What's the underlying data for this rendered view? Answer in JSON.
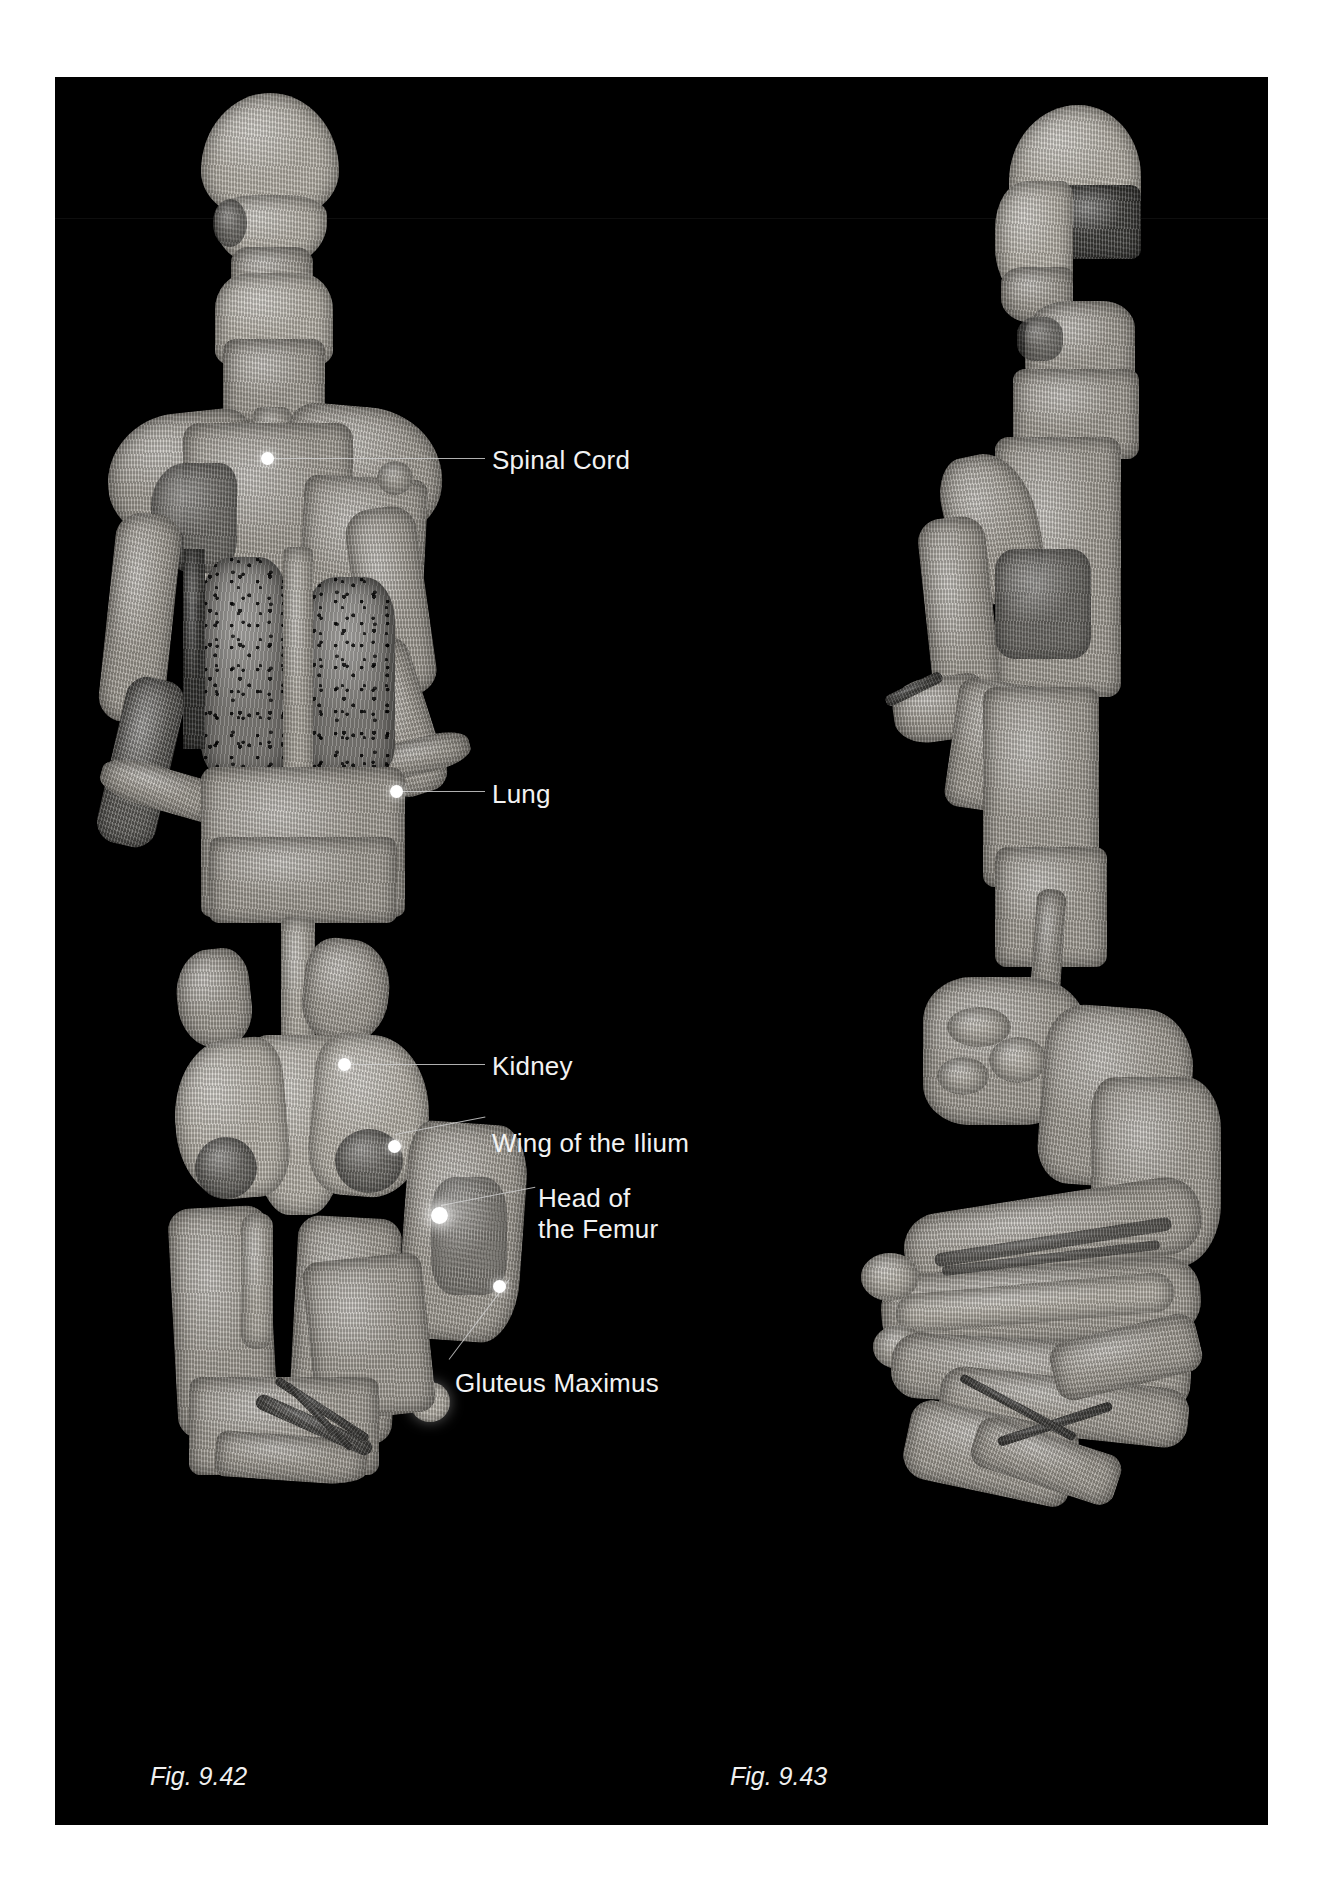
{
  "figure": {
    "domain": "anatomy-atlas-plate",
    "background_color": "#000000",
    "page_color": "#ffffff",
    "label_color": "#f2f2f2",
    "leader_color": "#cfcfcf",
    "marker_color": "#ffffff"
  },
  "labels": [
    {
      "id": "spinal-cord",
      "text": "Spinal Cord",
      "x": 437,
      "y": 368
    },
    {
      "id": "lung",
      "text": "Lung",
      "x": 437,
      "y": 702
    },
    {
      "id": "kidney",
      "text": "Kidney",
      "x": 437,
      "y": 974
    },
    {
      "id": "wing-of-the-ilium",
      "text": "Wing of the Ilium",
      "x": 437,
      "y": 1051
    },
    {
      "id": "head-of-femur-1",
      "text": "Head of",
      "x": 483,
      "y": 1106
    },
    {
      "id": "head-of-femur-2",
      "text": "the Femur",
      "x": 483,
      "y": 1136
    },
    {
      "id": "gluteus-maximus",
      "text": "Gluteus Maximus",
      "x": 400,
      "y": 1291
    }
  ],
  "captions": [
    {
      "id": "fig-9-42",
      "text": "Fig. 9.42",
      "x": 150,
      "y": 1762
    },
    {
      "id": "fig-9-43",
      "text": "Fig. 9.43",
      "x": 730,
      "y": 1762
    }
  ],
  "views": [
    {
      "id": "posterior-view",
      "caption": "Fig. 9.42",
      "orientation": "posterior"
    },
    {
      "id": "lateral-view",
      "caption": "Fig. 9.43",
      "orientation": "lateral"
    }
  ],
  "structures_labeled": [
    "Spinal Cord",
    "Lung",
    "Kidney",
    "Wing of the Ilium",
    "Head of the Femur",
    "Gluteus Maximus"
  ]
}
